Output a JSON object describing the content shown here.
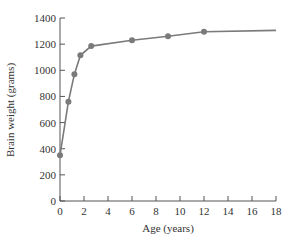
{
  "chart_data": {
    "type": "line",
    "title": "",
    "xlabel": "Age (years)",
    "ylabel": "Brain weight (grams)",
    "xlim": [
      0,
      18
    ],
    "ylim": [
      0,
      1400
    ],
    "xticks": [
      0,
      2,
      4,
      6,
      8,
      10,
      12,
      14,
      16,
      18
    ],
    "yticks": [
      0,
      200,
      400,
      600,
      800,
      1000,
      1200,
      1400
    ],
    "grid": false,
    "legend": null,
    "series": [
      {
        "name": "Brain weight",
        "x": [
          0,
          0.7,
          1.2,
          1.7,
          2.6,
          6,
          9,
          12
        ],
        "y": [
          350,
          760,
          970,
          1115,
          1185,
          1230,
          1260,
          1295
        ],
        "markers": true
      }
    ],
    "curve_extension": {
      "x": 18,
      "y": 1305
    },
    "colors": {
      "line": "#7a7a7a",
      "marker": "#7a7a7a",
      "axis": "#555555"
    }
  }
}
